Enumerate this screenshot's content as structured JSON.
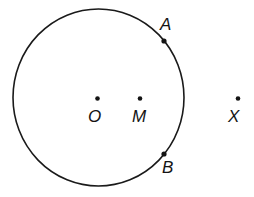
{
  "diagram": {
    "type": "geometry",
    "circle": {
      "center_label": "O",
      "stroke": "#1a1a1a"
    },
    "points": [
      {
        "id": "A",
        "label": "A",
        "on_circle": true
      },
      {
        "id": "O",
        "label": "O",
        "role": "center"
      },
      {
        "id": "M",
        "label": "M"
      },
      {
        "id": "X",
        "label": "X"
      },
      {
        "id": "B",
        "label": "B",
        "on_circle": true
      }
    ],
    "ink_color": "#141414",
    "background": "#ffffff"
  }
}
